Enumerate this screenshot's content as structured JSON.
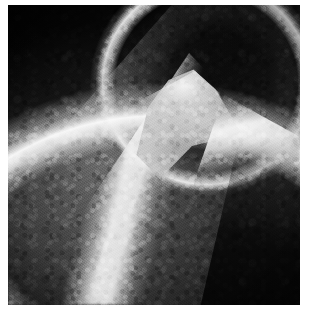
{
  "image": {
    "kind": "radiograph",
    "modality_label": "mammogram",
    "colorspace": "grayscale",
    "width_px": 313,
    "height_px": 317,
    "has_text_overlay": false,
    "has_ui_chrome": false,
    "alt_text": "Grayscale mammographic radiograph showing a dense breast with a bright curved superior skin border, a dark rounded lobular region in the upper right, a prominent bright triangular cusp at centre, and bright diagonal trabecular bands running toward the lower left and lower right.",
    "caption": ""
  },
  "frame": {
    "background_color": "#ffffff",
    "film_background_color": "#000000",
    "margin_left_px": 8,
    "margin_top_px": 5,
    "margin_right_px": 13,
    "margin_bottom_px": 12,
    "film_width_px": 292,
    "film_height_px": 300
  },
  "tones": {
    "film_black": "#060606",
    "deep_shadow": "#141414",
    "mid_shadow": "#262626",
    "mid_gray": "#6e6e6e",
    "light_gray": "#b9b9b9",
    "highlight": "#ececec",
    "specular_white": "#fafafa",
    "page_white": "#ffffff"
  },
  "features": [
    {
      "id": "superior-rim-arc",
      "label": "Bright curved superior border",
      "position": "upper-left to upper-centre",
      "brightness": "high",
      "shape": "arc"
    },
    {
      "id": "dark-lobe",
      "label": "Dark rounded lobular region",
      "position": "upper-right",
      "brightness": "very-low",
      "shape": "ellipse"
    },
    {
      "id": "lobe-rim",
      "label": "Bright lateral rim of dark lobe",
      "position": "right of upper-right lobe",
      "brightness": "high",
      "shape": "crescent"
    },
    {
      "id": "central-cusp",
      "label": "Bright triangular cusp",
      "position": "centre, apex toward upper-right",
      "brightness": "very-high",
      "shape": "wedge"
    },
    {
      "id": "main-diagonal-band",
      "label": "Bright diagonal trabecular band",
      "position": "centre to lower-left",
      "brightness": "high",
      "shape": "band"
    },
    {
      "id": "right-diagonal-ridge",
      "label": "Bright diagonal ridge",
      "position": "right side to bottom-centre",
      "brightness": "high",
      "shape": "band"
    },
    {
      "id": "parenchymal-texture",
      "label": "Mottled granular parenchymal texture",
      "position": "throughout tissue field",
      "brightness": "mid",
      "shape": "speckle"
    },
    {
      "id": "dark-background-field",
      "label": "Dark background field",
      "position": "top-left corner and lower-right corner",
      "brightness": "very-low",
      "shape": "wedge"
    }
  ]
}
